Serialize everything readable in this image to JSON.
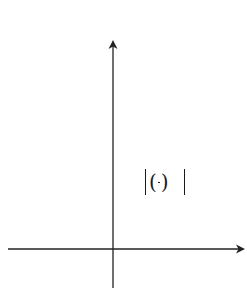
{
  "chart_data": {
    "type": "line",
    "title": "",
    "xlabel": "x",
    "ylabel": "y",
    "annotation": "y = |(1/2)^x − 1|",
    "equation": {
      "lhs": "y",
      "eq": "=",
      "base_num": "1",
      "base_den": "2",
      "exponent": "x",
      "minus": "−",
      "const": "1"
    },
    "grid": true,
    "grid_units": {
      "x_min": -6,
      "x_max": 6,
      "y_min": -2,
      "y_max": 10
    },
    "xlim": [
      -6,
      6.5
    ],
    "ylim": [
      -2,
      11
    ],
    "series": [
      {
        "name": "y = |(1/2)^x - 1|",
        "x": [
          -3.46,
          -3,
          -2.5,
          -2,
          -1.5,
          -1,
          -0.5,
          0,
          0.5,
          1,
          2,
          3,
          4,
          5,
          6
        ],
        "y": [
          10,
          7,
          4.66,
          3,
          1.83,
          1,
          0.41,
          0,
          0.29,
          0.5,
          0.75,
          0.875,
          0.94,
          0.97,
          0.98
        ]
      }
    ],
    "colors": {
      "curve": "#1a1a1a",
      "grid": "#555555",
      "axis": "#222222"
    }
  }
}
